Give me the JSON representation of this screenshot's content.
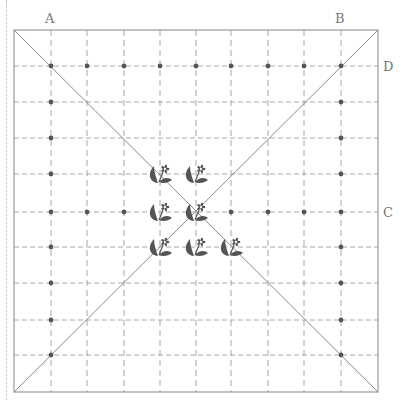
{
  "labels": {
    "A": {
      "text": "A",
      "x": 45,
      "y": 12
    },
    "B": {
      "text": "B",
      "x": 335,
      "y": 12
    },
    "C": {
      "text": "C",
      "x": 383,
      "y": 206
    },
    "D": {
      "text": "D",
      "x": 383,
      "y": 60
    }
  },
  "board": {
    "left": 14,
    "top": 30,
    "right": 378,
    "bottom": 392,
    "border_color": "#9a9a9a",
    "grid_color": "#a8a8a8",
    "diagonal_color": "#8c8c8c",
    "dot_color": "#555555",
    "flower_color": "#555555",
    "grid_x": [
      51,
      87,
      124,
      160,
      196,
      231,
      268,
      304,
      341
    ],
    "grid_y": [
      66,
      102,
      138,
      174,
      212,
      247,
      283,
      320,
      355
    ]
  },
  "dots": [
    [
      51,
      66
    ],
    [
      87,
      66
    ],
    [
      124,
      66
    ],
    [
      160,
      66
    ],
    [
      196,
      66
    ],
    [
      231,
      66
    ],
    [
      268,
      66
    ],
    [
      304,
      66
    ],
    [
      341,
      66
    ],
    [
      51,
      102
    ],
    [
      341,
      102
    ],
    [
      51,
      138
    ],
    [
      341,
      138
    ],
    [
      51,
      174
    ],
    [
      341,
      174
    ],
    [
      51,
      212
    ],
    [
      87,
      212
    ],
    [
      124,
      212
    ],
    [
      231,
      212
    ],
    [
      268,
      212
    ],
    [
      304,
      212
    ],
    [
      341,
      212
    ],
    [
      51,
      247
    ],
    [
      341,
      247
    ],
    [
      51,
      283
    ],
    [
      341,
      283
    ],
    [
      51,
      320
    ],
    [
      341,
      320
    ],
    [
      51,
      355
    ],
    [
      341,
      355
    ]
  ],
  "flowers": [
    [
      160,
      174
    ],
    [
      196,
      174
    ],
    [
      160,
      212
    ],
    [
      196,
      212
    ],
    [
      160,
      247
    ],
    [
      196,
      247
    ],
    [
      231,
      247
    ]
  ]
}
